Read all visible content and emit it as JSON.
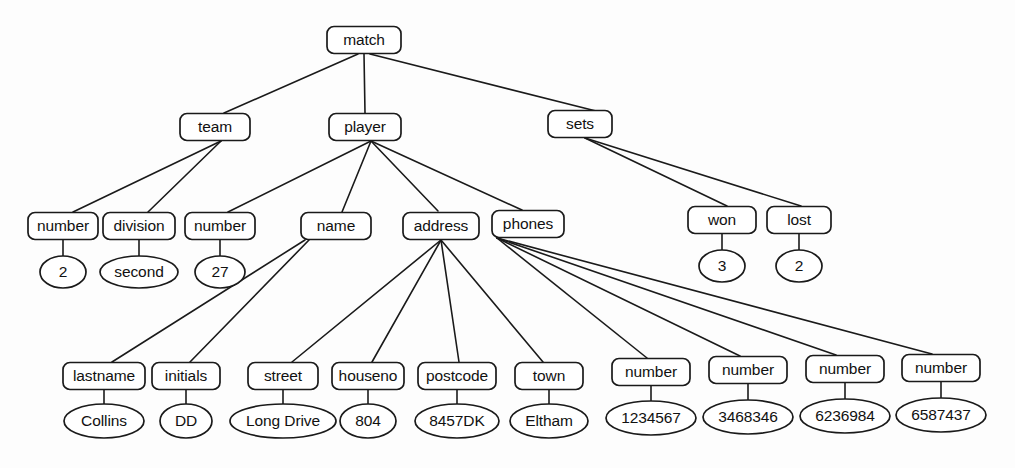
{
  "diagram": {
    "type": "tree-diagram",
    "stroke_color": "#1a1a1a",
    "fill_color": "#ffffff",
    "background_color": "#fdfdfd",
    "nodes": [
      {
        "id": "match",
        "label": "match",
        "shape": "box",
        "cx": 364,
        "cy": 40,
        "w": 74,
        "h": 27
      },
      {
        "id": "team",
        "label": "team",
        "shape": "box",
        "cx": 215,
        "cy": 127,
        "w": 70,
        "h": 27
      },
      {
        "id": "player",
        "label": "player",
        "shape": "box",
        "cx": 365,
        "cy": 127,
        "w": 72,
        "h": 27
      },
      {
        "id": "sets",
        "label": "sets",
        "shape": "box",
        "cx": 580,
        "cy": 124,
        "w": 64,
        "h": 27
      },
      {
        "id": "teamnumber",
        "label": "number",
        "shape": "box",
        "cx": 63,
        "cy": 226,
        "w": 70,
        "h": 27
      },
      {
        "id": "division",
        "label": "division",
        "shape": "box",
        "cx": 139,
        "cy": 226,
        "w": 72,
        "h": 27
      },
      {
        "id": "playernumber",
        "label": "number",
        "shape": "box",
        "cx": 220,
        "cy": 226,
        "w": 70,
        "h": 27
      },
      {
        "id": "name",
        "label": "name",
        "shape": "box",
        "cx": 336,
        "cy": 226,
        "w": 70,
        "h": 27
      },
      {
        "id": "address",
        "label": "address",
        "shape": "box",
        "cx": 441,
        "cy": 226,
        "w": 76,
        "h": 27
      },
      {
        "id": "phones",
        "label": "phones",
        "shape": "box",
        "cx": 528,
        "cy": 224,
        "w": 72,
        "h": 27
      },
      {
        "id": "won",
        "label": "won",
        "shape": "box",
        "cx": 722,
        "cy": 220,
        "w": 68,
        "h": 27
      },
      {
        "id": "lost",
        "label": "lost",
        "shape": "box",
        "cx": 799,
        "cy": 220,
        "w": 64,
        "h": 27
      },
      {
        "id": "val2",
        "label": "2",
        "shape": "ellipse",
        "cx": 63,
        "cy": 272,
        "w": 46,
        "h": 32
      },
      {
        "id": "valsecond",
        "label": "second",
        "shape": "ellipse",
        "cx": 139,
        "cy": 272,
        "w": 78,
        "h": 32
      },
      {
        "id": "val27",
        "label": "27",
        "shape": "ellipse",
        "cx": 220,
        "cy": 272,
        "w": 50,
        "h": 32
      },
      {
        "id": "val3",
        "label": "3",
        "shape": "ellipse",
        "cx": 722,
        "cy": 266,
        "w": 46,
        "h": 32
      },
      {
        "id": "vallost2",
        "label": "2",
        "shape": "ellipse",
        "cx": 799,
        "cy": 266,
        "w": 46,
        "h": 32
      },
      {
        "id": "lastname",
        "label": "lastname",
        "shape": "box",
        "cx": 104,
        "cy": 376,
        "w": 82,
        "h": 27
      },
      {
        "id": "initials",
        "label": "initials",
        "shape": "box",
        "cx": 186,
        "cy": 376,
        "w": 68,
        "h": 27
      },
      {
        "id": "street",
        "label": "street",
        "shape": "box",
        "cx": 283,
        "cy": 376,
        "w": 70,
        "h": 27
      },
      {
        "id": "houseno",
        "label": "houseno",
        "shape": "box",
        "cx": 368,
        "cy": 376,
        "w": 72,
        "h": 27
      },
      {
        "id": "postcode",
        "label": "postcode",
        "shape": "box",
        "cx": 457,
        "cy": 376,
        "w": 78,
        "h": 27
      },
      {
        "id": "town",
        "label": "town",
        "shape": "box",
        "cx": 549,
        "cy": 376,
        "w": 68,
        "h": 27
      },
      {
        "id": "ph1",
        "label": "number",
        "shape": "box",
        "cx": 651,
        "cy": 372,
        "w": 78,
        "h": 27
      },
      {
        "id": "ph2",
        "label": "number",
        "shape": "box",
        "cx": 748,
        "cy": 370,
        "w": 78,
        "h": 27
      },
      {
        "id": "ph3",
        "label": "number",
        "shape": "box",
        "cx": 845,
        "cy": 369,
        "w": 78,
        "h": 27
      },
      {
        "id": "ph4",
        "label": "number",
        "shape": "box",
        "cx": 941,
        "cy": 368,
        "w": 78,
        "h": 27
      },
      {
        "id": "vcollins",
        "label": "Collins",
        "shape": "ellipse",
        "cx": 104,
        "cy": 421,
        "w": 80,
        "h": 34
      },
      {
        "id": "vdd",
        "label": "DD",
        "shape": "ellipse",
        "cx": 186,
        "cy": 421,
        "w": 52,
        "h": 34
      },
      {
        "id": "vlongdrive",
        "label": "Long Drive",
        "shape": "ellipse",
        "cx": 283,
        "cy": 421,
        "w": 106,
        "h": 34
      },
      {
        "id": "v804",
        "label": "804",
        "shape": "ellipse",
        "cx": 368,
        "cy": 421,
        "w": 56,
        "h": 34
      },
      {
        "id": "v8457dk",
        "label": "8457DK",
        "shape": "ellipse",
        "cx": 457,
        "cy": 421,
        "w": 84,
        "h": 34
      },
      {
        "id": "veltham",
        "label": "Eltham",
        "shape": "ellipse",
        "cx": 549,
        "cy": 421,
        "w": 78,
        "h": 34
      },
      {
        "id": "v1234567",
        "label": "1234567",
        "shape": "ellipse",
        "cx": 651,
        "cy": 418,
        "w": 90,
        "h": 34
      },
      {
        "id": "v3468346",
        "label": "3468346",
        "shape": "ellipse",
        "cx": 748,
        "cy": 417,
        "w": 90,
        "h": 34
      },
      {
        "id": "v6236984",
        "label": "6236984",
        "shape": "ellipse",
        "cx": 845,
        "cy": 416,
        "w": 90,
        "h": 34
      },
      {
        "id": "v6587437",
        "label": "6587437",
        "shape": "ellipse",
        "cx": 941,
        "cy": 415,
        "w": 90,
        "h": 34
      }
    ],
    "edges": [
      {
        "from": "match",
        "to": "team",
        "x1": 358,
        "y1": 54,
        "x2": 224,
        "y2": 113
      },
      {
        "from": "match",
        "to": "player",
        "x1": 364,
        "y1": 54,
        "x2": 365,
        "y2": 113
      },
      {
        "from": "match",
        "to": "sets",
        "x1": 370,
        "y1": 54,
        "x2": 596,
        "y2": 111
      },
      {
        "from": "team",
        "to": "teamnumber",
        "x1": 221,
        "y1": 141,
        "x2": 73,
        "y2": 212
      },
      {
        "from": "team",
        "to": "division",
        "x1": 221,
        "y1": 141,
        "x2": 148,
        "y2": 212
      },
      {
        "from": "player",
        "to": "playernumber",
        "x1": 371,
        "y1": 141,
        "x2": 228,
        "y2": 212
      },
      {
        "from": "player",
        "to": "name",
        "x1": 371,
        "y1": 141,
        "x2": 342,
        "y2": 212
      },
      {
        "from": "player",
        "to": "address",
        "x1": 371,
        "y1": 141,
        "x2": 438,
        "y2": 211
      },
      {
        "from": "player",
        "to": "phones",
        "x1": 371,
        "y1": 141,
        "x2": 522,
        "y2": 210
      },
      {
        "from": "sets",
        "to": "won",
        "x1": 585,
        "y1": 138,
        "x2": 727,
        "y2": 206
      },
      {
        "from": "sets",
        "to": "lost",
        "x1": 585,
        "y1": 138,
        "x2": 801,
        "y2": 206
      },
      {
        "from": "teamnumber",
        "to": "val2",
        "x1": 63,
        "y1": 240,
        "x2": 63,
        "y2": 256
      },
      {
        "from": "division",
        "to": "valsecond",
        "x1": 139,
        "y1": 240,
        "x2": 139,
        "y2": 256
      },
      {
        "from": "playernumber",
        "to": "val27",
        "x1": 220,
        "y1": 240,
        "x2": 220,
        "y2": 256
      },
      {
        "from": "won",
        "to": "val3",
        "x1": 722,
        "y1": 234,
        "x2": 722,
        "y2": 250
      },
      {
        "from": "lost",
        "to": "vallost2",
        "x1": 799,
        "y1": 234,
        "x2": 799,
        "y2": 250
      },
      {
        "from": "name",
        "to": "lastname",
        "x1": 305,
        "y1": 240,
        "x2": 112,
        "y2": 362
      },
      {
        "from": "name",
        "to": "initials",
        "x1": 309,
        "y1": 240,
        "x2": 190,
        "y2": 362
      },
      {
        "from": "address",
        "to": "street",
        "x1": 441,
        "y1": 240,
        "x2": 292,
        "y2": 362
      },
      {
        "from": "address",
        "to": "houseno",
        "x1": 441,
        "y1": 240,
        "x2": 372,
        "y2": 362
      },
      {
        "from": "address",
        "to": "postcode",
        "x1": 441,
        "y1": 240,
        "x2": 459,
        "y2": 362
      },
      {
        "from": "address",
        "to": "town",
        "x1": 441,
        "y1": 240,
        "x2": 543,
        "y2": 362
      },
      {
        "from": "phones",
        "to": "ph1",
        "x1": 497,
        "y1": 238,
        "x2": 647,
        "y2": 358
      },
      {
        "from": "phones",
        "to": "ph2",
        "x1": 497,
        "y1": 238,
        "x2": 740,
        "y2": 356
      },
      {
        "from": "phones",
        "to": "ph3",
        "x1": 497,
        "y1": 238,
        "x2": 836,
        "y2": 355
      },
      {
        "from": "phones",
        "to": "ph4",
        "x1": 497,
        "y1": 238,
        "x2": 932,
        "y2": 354
      },
      {
        "from": "lastname",
        "to": "vcollins",
        "x1": 104,
        "y1": 390,
        "x2": 104,
        "y2": 404
      },
      {
        "from": "initials",
        "to": "vdd",
        "x1": 186,
        "y1": 390,
        "x2": 186,
        "y2": 404
      },
      {
        "from": "street",
        "to": "vlongdrive",
        "x1": 283,
        "y1": 390,
        "x2": 283,
        "y2": 404
      },
      {
        "from": "houseno",
        "to": "v804",
        "x1": 368,
        "y1": 390,
        "x2": 368,
        "y2": 404
      },
      {
        "from": "postcode",
        "to": "v8457dk",
        "x1": 457,
        "y1": 390,
        "x2": 457,
        "y2": 404
      },
      {
        "from": "town",
        "to": "veltham",
        "x1": 549,
        "y1": 390,
        "x2": 549,
        "y2": 404
      },
      {
        "from": "ph1",
        "to": "v1234567",
        "x1": 651,
        "y1": 386,
        "x2": 651,
        "y2": 401
      },
      {
        "from": "ph2",
        "to": "v3468346",
        "x1": 748,
        "y1": 384,
        "x2": 748,
        "y2": 400
      },
      {
        "from": "ph3",
        "to": "v6236984",
        "x1": 845,
        "y1": 383,
        "x2": 845,
        "y2": 399
      },
      {
        "from": "ph4",
        "to": "v6587437",
        "x1": 941,
        "y1": 382,
        "x2": 941,
        "y2": 398
      }
    ]
  }
}
